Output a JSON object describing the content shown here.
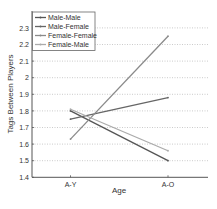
{
  "chart_data": {
    "type": "line",
    "title": "",
    "xlabel": "Age",
    "ylabel": "Tags Between Players",
    "categories": [
      "A-Y",
      "A-O"
    ],
    "ylim": [
      1.4,
      2.4
    ],
    "yticks": [
      1.4,
      1.5,
      1.6,
      1.7,
      1.8,
      1.9,
      2,
      2.1,
      2.2,
      2.3
    ],
    "grid": "horizontal dotted",
    "legend_position": "upper left",
    "series": [
      {
        "name": "Male-Male",
        "values": [
          1.8,
          1.5
        ],
        "color": "#555555"
      },
      {
        "name": "Male-Female",
        "values": [
          1.75,
          1.88
        ],
        "color": "#666666"
      },
      {
        "name": "Female-Female",
        "values": [
          1.63,
          2.25
        ],
        "color": "#8a8a8a"
      },
      {
        "name": "Female-Male",
        "values": [
          1.81,
          1.56
        ],
        "color": "#ababab"
      }
    ]
  }
}
